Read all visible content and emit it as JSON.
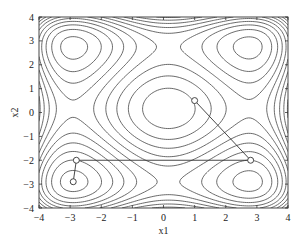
{
  "chart_data": {
    "type": "contour",
    "title": "",
    "xlabel": "x1",
    "ylabel": "x2",
    "xlim": [
      -4,
      4
    ],
    "ylim": [
      -4,
      4
    ],
    "xticks": [
      -4,
      -3,
      -2,
      -1,
      0,
      1,
      2,
      3,
      4
    ],
    "yticks": [
      -4,
      -3,
      -2,
      -1,
      0,
      1,
      2,
      3,
      4
    ],
    "xtick_labels": [
      "−4",
      "−3",
      "−2",
      "−1",
      "0",
      "1",
      "2",
      "3",
      "4"
    ],
    "ytick_labels": [
      "−4",
      "−3",
      "−2",
      "−1",
      "0",
      "1",
      "2",
      "3",
      "4"
    ],
    "grid": false,
    "legend": null,
    "surface": {
      "description": "2-D Styblinski-Tang function f(x1,x2) = 0.5*sum(xi^4 - 16 xi^2 + 5 xi)",
      "minima": [
        [
          -2.9,
          -2.9
        ],
        [
          2.75,
          -2.9
        ],
        [
          -2.9,
          2.75
        ],
        [
          2.75,
          2.75
        ]
      ],
      "central_maximum": [
        0.16,
        0.16
      ],
      "levels": [
        -75,
        -68,
        -61,
        -54,
        -47,
        -40,
        -33,
        -26,
        -19,
        -12,
        -5,
        2,
        9,
        16,
        23,
        30
      ]
    },
    "optimization_path": {
      "x1": [
        1.0,
        2.8,
        -2.8,
        -2.9
      ],
      "x2": [
        0.5,
        -2.0,
        -2.0,
        -2.9
      ],
      "marker": "open-circle"
    },
    "plot_area_px": {
      "left": 39,
      "top": 17,
      "right": 288,
      "bottom": 208
    }
  }
}
